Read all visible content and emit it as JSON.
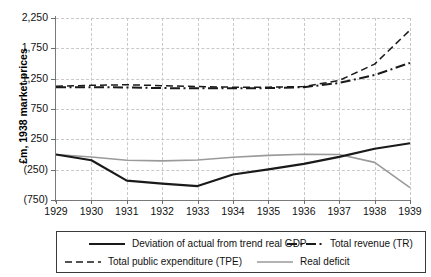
{
  "chart_data": {
    "type": "line",
    "title": "",
    "xlabel": "",
    "ylabel": "£m, 1938 market prices",
    "x": [
      1929,
      1930,
      1931,
      1932,
      1933,
      1934,
      1935,
      1936,
      1937,
      1938,
      1939
    ],
    "xticklabels": [
      "1929",
      "1930",
      "1931",
      "1932",
      "1933",
      "1934",
      "1935",
      "1936",
      "1937",
      "1938",
      "1939"
    ],
    "yticks": [
      -750,
      -250,
      250,
      750,
      1250,
      1750,
      2250
    ],
    "yticklabels": [
      "(750)",
      "(250)",
      "250",
      "750",
      "1,250",
      "1,750",
      "2,250"
    ],
    "ylim": [
      -750,
      2250
    ],
    "xlim": [
      1929,
      1939
    ],
    "grid": true,
    "legend_position": "below",
    "series": [
      {
        "name": "Deviation of actual from trend real GDP",
        "key": "gdp_deviation",
        "style": "solid",
        "color": "#1a1a1a",
        "width": 2.2,
        "values": [
          0,
          -95,
          -430,
          -480,
          -520,
          -330,
          -245,
          -155,
          -40,
          95,
          185
        ]
      },
      {
        "name": "Total public expenditure (TPE)",
        "key": "tpe",
        "style": "dashed",
        "color": "#1a1a1a",
        "width": 1.5,
        "values": [
          1125,
          1140,
          1150,
          1135,
          1120,
          1110,
          1110,
          1120,
          1220,
          1490,
          2050
        ]
      },
      {
        "name": "Total revenue (TR)",
        "key": "tr",
        "style": "dashdot",
        "color": "#1a1a1a",
        "width": 2.0,
        "values": [
          1110,
          1110,
          1105,
          1095,
          1090,
          1090,
          1095,
          1110,
          1180,
          1310,
          1510
        ]
      },
      {
        "name": "Real deficit",
        "key": "real_deficit",
        "style": "solid",
        "color": "#9a9a9a",
        "width": 1.6,
        "values": [
          0,
          -40,
          -95,
          -105,
          -90,
          -45,
          -15,
          5,
          0,
          -130,
          -545
        ]
      }
    ]
  },
  "axis": {
    "y_title": "£m, 1938 market prices"
  },
  "legend": {
    "items": [
      {
        "label": "Deviation of actual from trend real GDP",
        "key": "gdp_deviation"
      },
      {
        "label": "Total revenue (TR)",
        "key": "tr"
      },
      {
        "label": "Total public expenditure (TPE)",
        "key": "tpe"
      },
      {
        "label": "Real deficit",
        "key": "real_deficit"
      }
    ]
  }
}
